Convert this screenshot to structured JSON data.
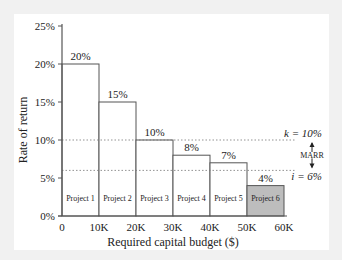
{
  "chart_data": {
    "type": "bar",
    "title": "",
    "xlabel": "Required capital budget ($)",
    "ylabel": "Rate of return",
    "categories": [
      "Project 1",
      "Project 2",
      "Project 3",
      "Project 4",
      "Project 5",
      "Project 6"
    ],
    "x_ranges": [
      [
        0,
        10
      ],
      [
        10,
        20
      ],
      [
        20,
        30
      ],
      [
        30,
        40
      ],
      [
        40,
        50
      ],
      [
        50,
        60
      ]
    ],
    "values": [
      20,
      15,
      10,
      8,
      7,
      4
    ],
    "value_labels": [
      "20%",
      "15%",
      "10%",
      "8%",
      "7%",
      "4%"
    ],
    "highlighted": "Project 6",
    "xlim": [
      0,
      60
    ],
    "ylim": [
      0,
      25
    ],
    "x_ticks": [
      "0",
      "10K",
      "20K",
      "30K",
      "40K",
      "50K",
      "60K"
    ],
    "y_ticks": [
      "0%",
      "5%",
      "10%",
      "15%",
      "20%",
      "25%"
    ],
    "reference_lines": [
      {
        "label": "k = 10%",
        "value": 10,
        "style": "dotted"
      },
      {
        "label": "i = 6%",
        "value": 6,
        "style": "dotted"
      }
    ],
    "annotation": "MARR",
    "grid": false
  },
  "colors": {
    "background": "#f1f1f1",
    "panel": "#ffffff",
    "bar_fill": "#ffffff",
    "highlight_fill": "#bdbdbd",
    "line": "#555555"
  }
}
